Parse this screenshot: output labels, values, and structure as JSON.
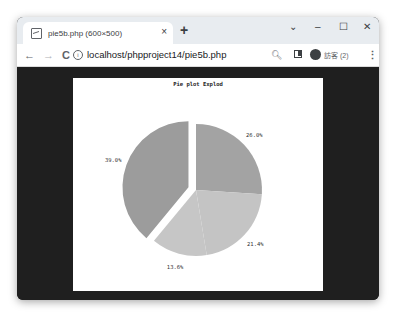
{
  "browser": {
    "tab": {
      "title": "pie5b.php (600×500)",
      "close_label": "×"
    },
    "new_tab_label": "+",
    "window_controls": {
      "dropdown": "⌄",
      "minimize": "–",
      "maximize": "☐",
      "close": "✕"
    },
    "toolbar": {
      "back_icon": "←",
      "forward_icon": "→",
      "reload_icon": "C",
      "info_icon": "i",
      "url": "localhost/phpproject14/pie5b.php",
      "zoom_icon": "🔍︎",
      "profile_label": "訪客 (2)",
      "menu_icon": "⋮"
    }
  },
  "chart_data": {
    "type": "pie",
    "title": "Pie plot Explod",
    "categories": [
      "Slice A",
      "Slice B",
      "Slice C",
      "Slice D"
    ],
    "values": [
      26.0,
      21.4,
      13.6,
      39.0
    ],
    "labels": [
      "26.0%",
      "21.4%",
      "13.6%",
      "39.0%"
    ],
    "colors": [
      "#a3a3a3",
      "#c4c4c4",
      "#c6c6c6",
      "#9c9c9c"
    ],
    "start_angle_deg": 90,
    "direction": "clockwise",
    "exploded_index": 3,
    "explode_px": 8,
    "legend": false
  }
}
